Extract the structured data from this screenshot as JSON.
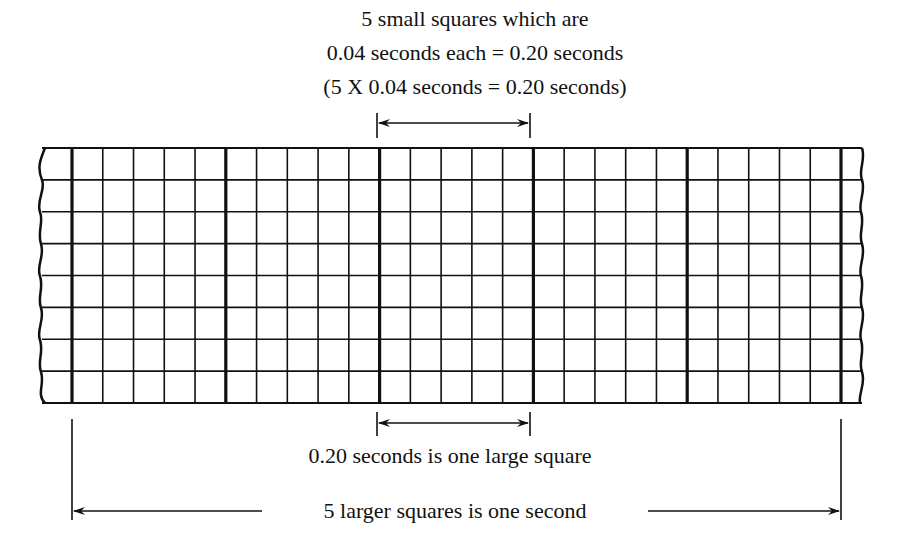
{
  "title": {
    "line1": "5 small squares which are",
    "line2": "0.04 seconds each = 0.20 seconds",
    "line3": "(5 X 0.04 seconds = 0.20 seconds)"
  },
  "labels": {
    "large_square": "0.20 seconds is one large square",
    "one_second": "5 larger squares is one second"
  },
  "grid": {
    "small_square_seconds": 0.04,
    "large_square_seconds": 0.2,
    "small_per_large": 5,
    "large_squares_in_span": 5,
    "rows": 8,
    "line_color": "#111111",
    "background": "#ffffff"
  }
}
